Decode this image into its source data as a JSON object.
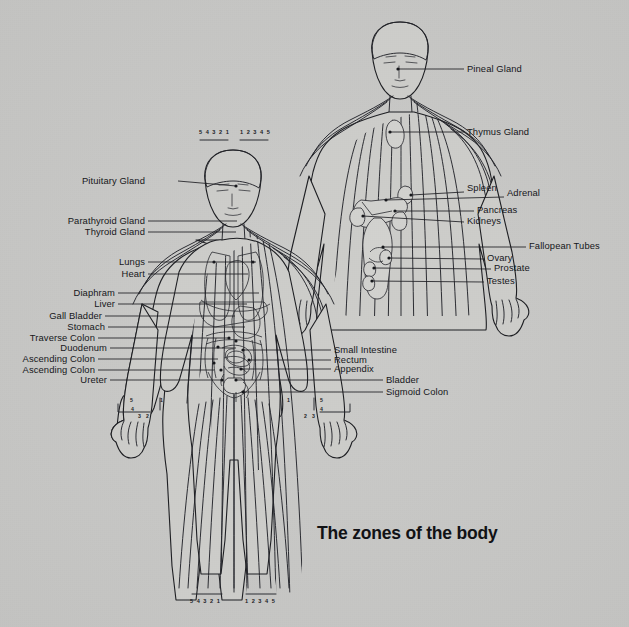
{
  "title": "The zones of the body",
  "background_color": "#c9c9c7",
  "ink_color": "#1a1b1f",
  "figures": {
    "front": {
      "name": "full-body-front-figure",
      "head_zone_numbers_left": "5 4 3 2 1",
      "head_zone_numbers_right": "1 2 3 4 5",
      "feet_zone_numbers_left": "5 4 3 2 1",
      "feet_zone_numbers_right": "1 2 3 4 5",
      "left_hand_zone_numbers": [
        "5",
        "4",
        "3",
        "2",
        "1"
      ],
      "right_hand_zone_numbers": [
        "1",
        "2",
        "3",
        "4",
        "5"
      ]
    },
    "torso": {
      "name": "upper-body-organs-figure"
    }
  },
  "labels_left": [
    {
      "text": "Pituitary Gland",
      "x": 164,
      "y": 178,
      "leader_to_x": 236,
      "leader_to_y": 186,
      "dot_x": 236,
      "dot_y": 186
    },
    {
      "text": "Parathyroid Gland",
      "x": 148,
      "y": 217,
      "leader_to_x": 230,
      "leader_to_y": 221,
      "dot_x": 0,
      "dot_y": 0
    },
    {
      "text": "Thyroid Gland",
      "x": 148,
      "y": 229,
      "leader_to_x": 229,
      "leader_to_y": 232,
      "dot_x": 0,
      "dot_y": 0
    },
    {
      "text": "Lungs",
      "x": 148,
      "y": 259,
      "leader_to_x": 255,
      "leader_to_y": 262,
      "dot_x": 214,
      "dot_y": 262
    },
    {
      "text": "Heart",
      "x": 148,
      "y": 272,
      "leader_to_x": 247,
      "leader_to_y": 274,
      "dot_x": 248,
      "dot_y": 274
    },
    {
      "text": "Diaphram",
      "x": 118,
      "y": 290,
      "leader_to_x": 253,
      "leader_to_y": 293,
      "dot_x": 0,
      "dot_y": 0
    },
    {
      "text": "Liver",
      "x": 118,
      "y": 302,
      "leader_to_x": 240,
      "leader_to_y": 304,
      "dot_x": 0,
      "dot_y": 0
    },
    {
      "text": "Gall Bladder",
      "x": 108,
      "y": 314,
      "leader_to_x": 228,
      "leader_to_y": 316,
      "dot_x": 0,
      "dot_y": 0
    },
    {
      "text": "Stomach",
      "x": 108,
      "y": 325,
      "leader_to_x": 239,
      "leader_to_y": 327,
      "dot_x": 0,
      "dot_y": 0
    },
    {
      "text": "Traverse Colon",
      "x": 100,
      "y": 336,
      "leader_to_x": 229,
      "leader_to_y": 338,
      "dot_x": 229,
      "dot_y": 338
    },
    {
      "text": "Duodenum",
      "x": 110,
      "y": 347,
      "leader_to_x": 236,
      "leader_to_y": 348,
      "dot_x": 236,
      "dot_y": 348
    },
    {
      "text": "Ascending Colon",
      "x": 100,
      "y": 357,
      "leader_to_x": 218,
      "leader_to_y": 359,
      "dot_x": 218,
      "dot_y": 359
    },
    {
      "text": "Ascending Colon",
      "x": 100,
      "y": 368,
      "leader_to_x": 214,
      "leader_to_y": 370,
      "dot_x": 214,
      "dot_y": 370
    },
    {
      "text": "Ureter",
      "x": 110,
      "y": 379,
      "leader_to_x": 222,
      "leader_to_y": 380,
      "dot_x": 222,
      "dot_y": 380
    }
  ],
  "labels_right_front": [
    {
      "text": "Small Intestine",
      "x": 334,
      "y": 348,
      "leader_from_x": 243,
      "leader_from_y": 350,
      "dot_x": 243,
      "dot_y": 350
    },
    {
      "text": "Rectum",
      "x": 334,
      "y": 358,
      "leader_from_x": 249,
      "leader_from_y": 360,
      "dot_x": 249,
      "dot_y": 360
    },
    {
      "text": "Appendix",
      "x": 334,
      "y": 368,
      "leader_from_x": 241,
      "leader_from_y": 369,
      "dot_x": 241,
      "dot_y": 369
    },
    {
      "text": "Bladder",
      "x": 386,
      "y": 378,
      "leader_from_x": 236,
      "leader_from_y": 380,
      "dot_x": 236,
      "dot_y": 380
    },
    {
      "text": "Sigmoid Colon",
      "x": 386,
      "y": 390,
      "leader_from_x": 243,
      "leader_from_y": 392,
      "dot_x": 243,
      "dot_y": 392
    }
  ],
  "labels_right_torso": [
    {
      "text": "Pineal Gland",
      "x": 468,
      "y": 68,
      "leader_from_x": 398,
      "leader_from_y": 69,
      "dot_x": 398,
      "dot_y": 69
    },
    {
      "text": "Thymus Gland",
      "x": 468,
      "y": 126,
      "leader_from_x": 390,
      "leader_from_y": 132,
      "dot_x": 390,
      "dot_y": 132
    },
    {
      "text": "Spleen",
      "x": 468,
      "y": 187,
      "leader_from_x": 411,
      "leader_from_y": 195,
      "dot_x": 411,
      "dot_y": 195
    },
    {
      "text": "Adrenal",
      "x": 508,
      "y": 191,
      "leader_from_x": 386,
      "leader_from_y": 200,
      "dot_x": 386,
      "dot_y": 200
    },
    {
      "text": "Pancreas",
      "x": 478,
      "y": 208,
      "leader_from_x": 395,
      "leader_from_y": 211,
      "dot_x": 395,
      "dot_y": 211
    },
    {
      "text": "Kidneys",
      "x": 468,
      "y": 219,
      "leader_from_x": 363,
      "leader_from_y": 216,
      "dot_x": 363,
      "dot_y": 216
    },
    {
      "text": "Fallopean Tubes",
      "x": 530,
      "y": 245,
      "leader_from_x": 383,
      "leader_from_y": 247,
      "dot_x": 383,
      "dot_y": 247
    },
    {
      "text": "Ovary",
      "x": 488,
      "y": 256,
      "leader_from_x": 389,
      "leader_from_y": 258,
      "dot_x": 389,
      "dot_y": 258
    },
    {
      "text": "Prostate",
      "x": 495,
      "y": 266,
      "leader_from_x": 374,
      "leader_from_y": 268,
      "dot_x": 374,
      "dot_y": 268
    },
    {
      "text": "Testes",
      "x": 488,
      "y": 280,
      "leader_from_x": 372,
      "leader_from_y": 281,
      "dot_x": 372,
      "dot_y": 281
    }
  ],
  "zone_numbers": {
    "front_head_left": "5 4 3 2 1",
    "front_head_right": "1 2 3 4 5",
    "front_feet_left": "5 4 3 2 1",
    "front_feet_right": "1 2 3 4 5",
    "left_hand": {
      "n5": "5",
      "n4": "4",
      "n3": "3",
      "n2": "2",
      "n1": "1"
    },
    "right_hand": {
      "n1": "1",
      "n2": "2",
      "n3": "3",
      "n4": "4",
      "n5": "5"
    }
  }
}
